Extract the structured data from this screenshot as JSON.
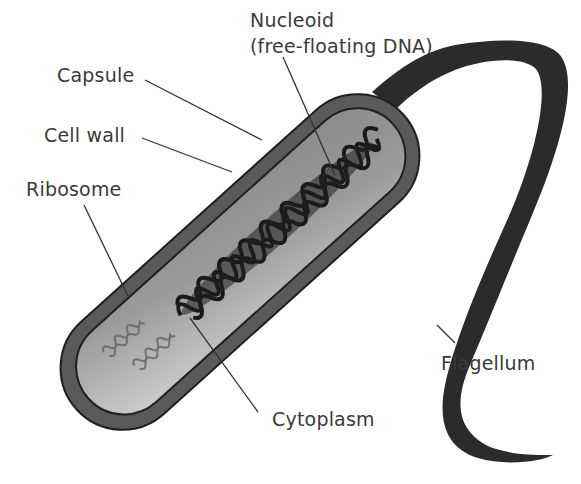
{
  "colors": {
    "background": "#ffffff",
    "capsule": "#595959",
    "cell_wall_line": "#2a2a2a",
    "cytoplasm_light": "#c9c9c9",
    "cytoplasm_dark": "#8c8c8c",
    "nucleoid": "#1e1e1e",
    "ribosome": "#7a7a7a",
    "flagellum": "#2b2b2b",
    "leader_line": "#333333",
    "label_text": "#3a3a3a"
  },
  "labels": {
    "nucleoid_line1": "Nucleoid",
    "nucleoid_line2": "(free-floating DNA)",
    "capsule": "Capsule",
    "cell_wall": "Cell wall",
    "ribosome": "Ribosome",
    "flagellum": "Flagellum",
    "cytoplasm": "Cytoplasm"
  },
  "parts": [
    {
      "name": "Nucleoid (free-floating DNA)",
      "points_to": "coiled DNA mass in center of cell"
    },
    {
      "name": "Capsule",
      "points_to": "outer dark layer"
    },
    {
      "name": "Cell wall",
      "points_to": "inner boundary line"
    },
    {
      "name": "Ribosome",
      "points_to": "small coiled structures near lower-left"
    },
    {
      "name": "Cytoplasm",
      "points_to": "gray interior fill"
    },
    {
      "name": "Flagellum",
      "points_to": "long whip-like tail"
    }
  ]
}
